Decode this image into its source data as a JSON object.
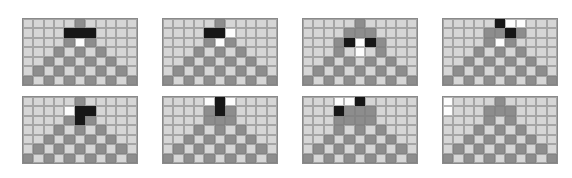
{
  "figure": {
    "layout": {
      "panel_rows": 2,
      "panel_cols": 4,
      "panel_count": 8,
      "grid_cols": 11,
      "grid_rows": 7,
      "cell_px": 10.5,
      "panel_left_px": [
        22,
        162,
        302,
        442
      ],
      "panel_top_px": [
        18,
        96
      ],
      "panel_width_px": 116,
      "panel_height_px": 68,
      "canvas_width_px": 572,
      "canvas_height_px": 178
    },
    "colors": {
      "background": "#ffffff",
      "cell_light": "#d6d6d6",
      "cell_dark": "#8d8d8d",
      "cell_black": "#171717",
      "cell_white": "#fdfdfd",
      "grid_line": "#8a8a8a"
    },
    "legend": {
      "light": "empty / background cell",
      "dark": "structure cell (pyramid)",
      "black": "marked cell (black)",
      "white": "marked cell (white)"
    }
  },
  "chart_data": {
    "type": "heatmap",
    "xlabel": "",
    "ylabel": "",
    "grid_cols": 11,
    "grid_rows": 7,
    "value_codes": {
      "0": "light",
      "1": "dark",
      "2": "black",
      "3": "white"
    },
    "panels": [
      {
        "index": 1,
        "name": "panel-1",
        "position": "row-1-col-1",
        "cells": [
          [
            0,
            0,
            0,
            0,
            0,
            1,
            0,
            0,
            0,
            0,
            0
          ],
          [
            0,
            0,
            0,
            0,
            2,
            2,
            2,
            0,
            0,
            0,
            0
          ],
          [
            0,
            0,
            0,
            0,
            1,
            3,
            1,
            0,
            0,
            0,
            0
          ],
          [
            0,
            0,
            0,
            1,
            0,
            1,
            0,
            1,
            0,
            0,
            0
          ],
          [
            0,
            0,
            1,
            0,
            1,
            0,
            1,
            0,
            1,
            0,
            0
          ],
          [
            0,
            1,
            0,
            1,
            0,
            1,
            0,
            1,
            0,
            1,
            0
          ],
          [
            1,
            0,
            1,
            0,
            1,
            0,
            1,
            0,
            1,
            0,
            1
          ]
        ]
      },
      {
        "index": 2,
        "name": "panel-2",
        "position": "row-1-col-2",
        "cells": [
          [
            0,
            0,
            0,
            0,
            0,
            1,
            0,
            0,
            0,
            0,
            0
          ],
          [
            0,
            0,
            0,
            0,
            2,
            2,
            3,
            0,
            0,
            0,
            0
          ],
          [
            0,
            0,
            0,
            0,
            1,
            3,
            1,
            0,
            0,
            0,
            0
          ],
          [
            0,
            0,
            0,
            1,
            0,
            1,
            0,
            1,
            0,
            0,
            0
          ],
          [
            0,
            0,
            1,
            0,
            1,
            0,
            1,
            0,
            1,
            0,
            0
          ],
          [
            0,
            1,
            0,
            1,
            0,
            1,
            0,
            1,
            0,
            1,
            0
          ],
          [
            1,
            0,
            1,
            0,
            1,
            0,
            1,
            0,
            1,
            0,
            1
          ]
        ]
      },
      {
        "index": 3,
        "name": "panel-3",
        "position": "row-1-col-3",
        "cells": [
          [
            0,
            0,
            0,
            0,
            0,
            1,
            0,
            0,
            0,
            0,
            0
          ],
          [
            0,
            0,
            0,
            0,
            1,
            1,
            1,
            0,
            0,
            0,
            0
          ],
          [
            0,
            0,
            0,
            1,
            2,
            3,
            2,
            1,
            0,
            0,
            0
          ],
          [
            0,
            0,
            0,
            1,
            0,
            3,
            0,
            1,
            0,
            0,
            0
          ],
          [
            0,
            0,
            1,
            0,
            1,
            0,
            1,
            0,
            1,
            0,
            0
          ],
          [
            0,
            1,
            0,
            1,
            0,
            1,
            0,
            1,
            0,
            1,
            0
          ],
          [
            1,
            0,
            1,
            0,
            1,
            0,
            1,
            0,
            1,
            0,
            1
          ]
        ]
      },
      {
        "index": 4,
        "name": "panel-4",
        "position": "row-1-col-4",
        "cells": [
          [
            0,
            0,
            0,
            0,
            0,
            2,
            3,
            3,
            0,
            0,
            0
          ],
          [
            0,
            0,
            0,
            0,
            1,
            1,
            2,
            1,
            0,
            0,
            0
          ],
          [
            0,
            0,
            0,
            0,
            1,
            3,
            1,
            0,
            0,
            0,
            0
          ],
          [
            0,
            0,
            0,
            1,
            0,
            1,
            0,
            1,
            0,
            0,
            0
          ],
          [
            0,
            0,
            1,
            0,
            1,
            0,
            1,
            0,
            1,
            0,
            0
          ],
          [
            0,
            1,
            0,
            1,
            0,
            1,
            0,
            1,
            0,
            1,
            0
          ],
          [
            1,
            0,
            1,
            0,
            1,
            0,
            1,
            0,
            1,
            0,
            1
          ]
        ]
      },
      {
        "index": 5,
        "name": "panel-5",
        "position": "row-2-col-1",
        "cells": [
          [
            0,
            0,
            0,
            0,
            0,
            1,
            0,
            0,
            0,
            0,
            0
          ],
          [
            0,
            0,
            0,
            0,
            3,
            2,
            2,
            0,
            0,
            0,
            0
          ],
          [
            0,
            0,
            0,
            0,
            1,
            2,
            1,
            0,
            0,
            0,
            0
          ],
          [
            0,
            0,
            0,
            1,
            0,
            1,
            0,
            1,
            0,
            0,
            0
          ],
          [
            0,
            0,
            1,
            0,
            1,
            0,
            1,
            0,
            1,
            0,
            0
          ],
          [
            0,
            1,
            0,
            1,
            0,
            1,
            0,
            1,
            0,
            1,
            0
          ],
          [
            1,
            0,
            1,
            0,
            1,
            0,
            1,
            0,
            1,
            0,
            1
          ]
        ]
      },
      {
        "index": 6,
        "name": "panel-6",
        "position": "row-2-col-2",
        "cells": [
          [
            0,
            0,
            0,
            0,
            3,
            2,
            3,
            0,
            0,
            0,
            0
          ],
          [
            0,
            0,
            0,
            0,
            1,
            2,
            1,
            0,
            0,
            0,
            0
          ],
          [
            0,
            0,
            0,
            0,
            1,
            1,
            1,
            0,
            0,
            0,
            0
          ],
          [
            0,
            0,
            0,
            1,
            0,
            1,
            0,
            1,
            0,
            0,
            0
          ],
          [
            0,
            0,
            1,
            0,
            1,
            0,
            1,
            0,
            1,
            0,
            0
          ],
          [
            0,
            1,
            0,
            1,
            0,
            1,
            0,
            1,
            0,
            1,
            0
          ],
          [
            1,
            0,
            1,
            0,
            1,
            0,
            1,
            0,
            1,
            0,
            1
          ]
        ]
      },
      {
        "index": 7,
        "name": "panel-7",
        "position": "row-2-col-3",
        "cells": [
          [
            0,
            0,
            0,
            3,
            3,
            2,
            0,
            0,
            0,
            0,
            0
          ],
          [
            0,
            0,
            0,
            2,
            1,
            1,
            1,
            0,
            0,
            0,
            0
          ],
          [
            0,
            0,
            0,
            1,
            1,
            1,
            1,
            0,
            0,
            0,
            0
          ],
          [
            0,
            0,
            0,
            1,
            0,
            1,
            0,
            1,
            0,
            0,
            0
          ],
          [
            0,
            0,
            1,
            0,
            1,
            0,
            1,
            0,
            1,
            0,
            0
          ],
          [
            0,
            1,
            0,
            1,
            0,
            1,
            0,
            1,
            0,
            1,
            0
          ],
          [
            1,
            0,
            1,
            0,
            1,
            0,
            1,
            0,
            1,
            0,
            1
          ]
        ]
      },
      {
        "index": 8,
        "name": "panel-8",
        "position": "row-2-col-4",
        "cells": [
          [
            3,
            0,
            0,
            0,
            0,
            1,
            0,
            0,
            0,
            0,
            0
          ],
          [
            3,
            0,
            0,
            0,
            1,
            1,
            1,
            0,
            0,
            0,
            0
          ],
          [
            0,
            0,
            0,
            0,
            1,
            0,
            1,
            0,
            0,
            0,
            0
          ],
          [
            0,
            0,
            0,
            1,
            0,
            1,
            0,
            1,
            0,
            0,
            0
          ],
          [
            0,
            0,
            1,
            0,
            1,
            0,
            1,
            0,
            1,
            0,
            0
          ],
          [
            0,
            1,
            0,
            1,
            0,
            1,
            0,
            1,
            0,
            1,
            0
          ],
          [
            1,
            0,
            1,
            0,
            1,
            0,
            1,
            0,
            1,
            0,
            1
          ]
        ]
      }
    ]
  }
}
